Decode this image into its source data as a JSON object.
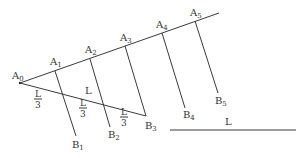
{
  "diagram": {
    "points_upper": [
      {
        "name": "A",
        "sub": "0"
      },
      {
        "name": "A",
        "sub": "1"
      },
      {
        "name": "A",
        "sub": "2"
      },
      {
        "name": "A",
        "sub": "3"
      },
      {
        "name": "A",
        "sub": "4"
      },
      {
        "name": "A",
        "sub": "5"
      }
    ],
    "points_lower": [
      {
        "name": "B",
        "sub": "1"
      },
      {
        "name": "B",
        "sub": "2"
      },
      {
        "name": "B",
        "sub": "3"
      },
      {
        "name": "B",
        "sub": "4"
      },
      {
        "name": "B",
        "sub": "5"
      }
    ],
    "segment_label": "L",
    "fraction_labels": [
      {
        "num": "L",
        "den": "3"
      },
      {
        "num": "L",
        "den": "3"
      },
      {
        "num": "L",
        "den": "3"
      }
    ],
    "reference_segment_label": "L",
    "colors": {
      "line": "#3a3a3a",
      "text": "#333333",
      "background": "#ffffff"
    }
  }
}
